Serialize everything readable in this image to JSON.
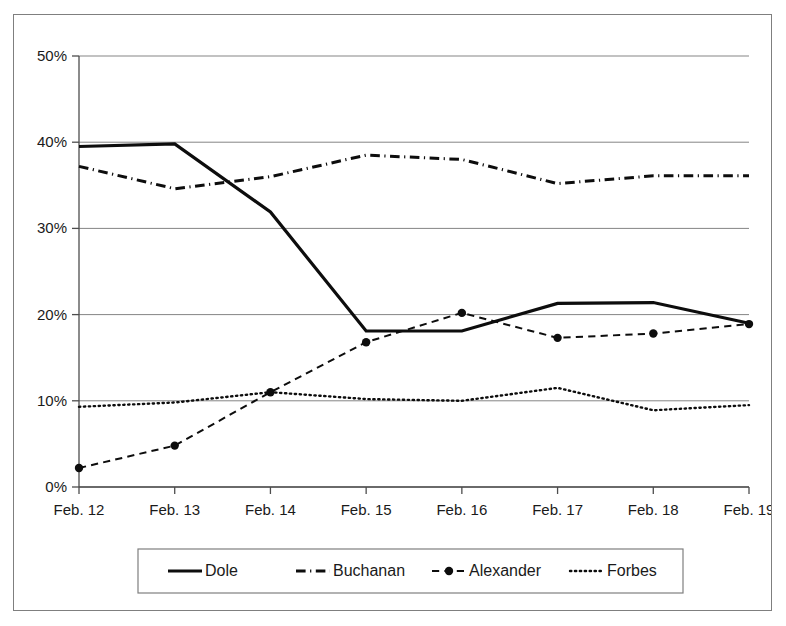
{
  "chart_data": {
    "type": "line",
    "title": "",
    "xlabel": "",
    "ylabel": "",
    "categories": [
      "Feb. 12",
      "Feb. 13",
      "Feb. 14",
      "Feb. 15",
      "Feb. 16",
      "Feb. 17",
      "Feb. 18",
      "Feb. 19"
    ],
    "ylim": [
      0,
      50
    ],
    "ytick_labels": [
      "0%",
      "10%",
      "20%",
      "30%",
      "40%",
      "50%"
    ],
    "ytick_values": [
      0,
      10,
      20,
      30,
      40,
      50
    ],
    "grid": "horizontal",
    "legend_position": "bottom-center",
    "value_suffix": "%",
    "series": [
      {
        "name": "Dole",
        "style": "solid",
        "color": "#0d0d0d",
        "width": 3.2,
        "markers": false,
        "values": [
          39.5,
          39.8,
          31.9,
          18.1,
          18.1,
          21.3,
          21.4,
          19.0
        ]
      },
      {
        "name": "Buchanan",
        "style": "dash-dot",
        "color": "#0d0d0d",
        "width": 3.0,
        "markers": false,
        "values": [
          37.2,
          34.6,
          36.0,
          38.5,
          38.0,
          35.2,
          36.1,
          36.1
        ]
      },
      {
        "name": "Alexander",
        "style": "dashed",
        "color": "#0d0d0d",
        "width": 2.0,
        "markers": true,
        "values": [
          2.2,
          4.8,
          11.0,
          16.8,
          20.2,
          17.3,
          17.8,
          18.9
        ]
      },
      {
        "name": "Forbes",
        "style": "dotted",
        "color": "#0d0d0d",
        "width": 2.4,
        "markers": false,
        "values": [
          9.3,
          9.8,
          11.0,
          10.2,
          10.0,
          11.5,
          8.9,
          9.5
        ]
      }
    ]
  },
  "legend": {
    "entries": [
      {
        "label": "Dole",
        "sample": "solid-line-sample"
      },
      {
        "label": "Buchanan",
        "sample": "dash-dot-line-sample"
      },
      {
        "label": "Alexander",
        "sample": "dash-dot-marker-line-sample"
      },
      {
        "label": "Forbes",
        "sample": "dotted-line-sample"
      }
    ]
  }
}
